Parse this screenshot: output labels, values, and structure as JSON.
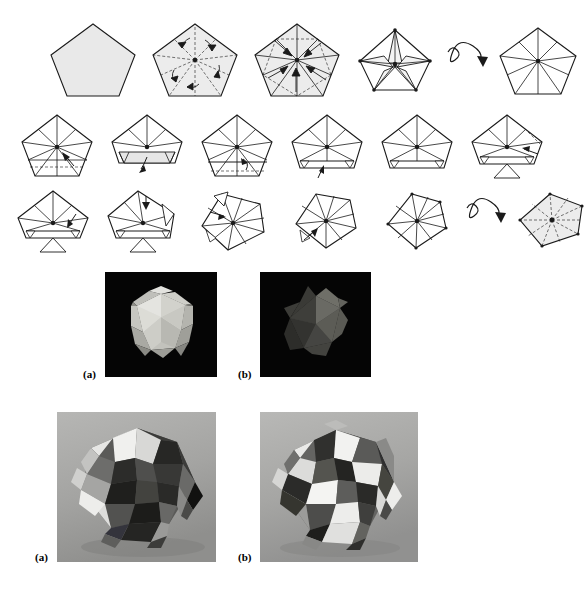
{
  "page": {
    "width": 459,
    "height": 589,
    "background": "#ffffff",
    "ink": "#1a1a1a",
    "fill_light": "#e8e8e8",
    "fill_mid": "#c9c9c9",
    "photo_black": "#050505",
    "photo_gray": "#9a9a9a"
  },
  "figure_diagrams": {
    "name": "pentagon-module-folding-sequence",
    "rows": [
      {
        "row_index": 1,
        "steps": [
          {
            "index": 1,
            "name": "blank-pentagon",
            "kind": "pentagon-plain",
            "shaded": true,
            "arrows": 0,
            "flip": false
          },
          {
            "index": 2,
            "name": "pentagon-crease-pattern",
            "kind": "pentagon-creased-curved-arrows",
            "shaded": true,
            "arrows": 5,
            "flip": false
          },
          {
            "index": 3,
            "name": "pentagon-collapse",
            "kind": "pentagon-collapse-straight-arrows",
            "shaded": true,
            "arrows": 5,
            "flip": false
          },
          {
            "index": 4,
            "name": "star-collapsed",
            "kind": "pentagon-star",
            "shaded": false,
            "arrows": 0,
            "flip": false
          },
          {
            "index": 5,
            "name": "turn-over-symbol",
            "kind": "flip-arrow",
            "shaded": false,
            "arrows": 1,
            "flip": true
          },
          {
            "index": 6,
            "name": "pentagon-ten-sector",
            "kind": "pentagon-radial-10",
            "shaded": false,
            "arrows": 0,
            "flip": false
          }
        ]
      },
      {
        "row_index": 2,
        "steps": [
          {
            "index": 7,
            "name": "fold-lower-edge",
            "kind": "pentagon-radial-fold-hint",
            "shaded": false,
            "arrows": 1,
            "flip": false
          },
          {
            "index": 8,
            "name": "lower-flap-open",
            "kind": "pentagon-flap-pull",
            "shaded": false,
            "arrows": 1,
            "flip": false
          },
          {
            "index": 9,
            "name": "fold-base-band",
            "kind": "pentagon-band-fold",
            "shaded": false,
            "arrows": 1,
            "flip": false
          },
          {
            "index": 10,
            "name": "corner-tabs-formed",
            "kind": "pentagon-corner-tabs",
            "shaded": false,
            "arrows": 1,
            "flip": false
          },
          {
            "index": 11,
            "name": "tabs-set",
            "kind": "pentagon-tabs-set",
            "shaded": false,
            "arrows": 0,
            "flip": false
          },
          {
            "index": 12,
            "name": "repeat-next-side",
            "kind": "pentagon-repeat-side",
            "shaded": false,
            "arrows": 1,
            "flip": false
          }
        ]
      },
      {
        "row_index": 3,
        "steps": [
          {
            "index": 13,
            "name": "third-side-fold",
            "kind": "pentagon-third-side",
            "shaded": false,
            "arrows": 1,
            "flip": false
          },
          {
            "index": 14,
            "name": "fourth-side-fold",
            "kind": "pentagon-fourth-side",
            "shaded": false,
            "arrows": 1,
            "flip": false
          },
          {
            "index": 15,
            "name": "fifth-side-fold",
            "kind": "pentagon-fifth-side",
            "shaded": false,
            "arrows": 1,
            "flip": false
          },
          {
            "index": 16,
            "name": "closing-pinwheel",
            "kind": "pentagon-pinwheel",
            "shaded": false,
            "arrows": 1,
            "flip": false
          },
          {
            "index": 17,
            "name": "finished-unit-front",
            "kind": "pentagon-finished",
            "shaded": false,
            "arrows": 0,
            "flip": false
          },
          {
            "index": 18,
            "name": "turn-over-symbol-2",
            "kind": "flip-arrow",
            "shaded": false,
            "arrows": 1,
            "flip": true
          },
          {
            "index": 19,
            "name": "finished-unit-back",
            "kind": "pentagon-finished-shaded",
            "shaded": true,
            "arrows": 0,
            "flip": false
          }
        ]
      }
    ]
  },
  "photo_figure_top": {
    "name": "single-module-photographs",
    "background": "#050505",
    "items": [
      {
        "label": "(a)",
        "name": "photo-module-front",
        "alt": "photograph of a single folded pentagonal module, front view, pale paper on black background",
        "x": 105,
        "y": 272,
        "w": 112,
        "h": 105,
        "label_x": 83,
        "label_y": 369
      },
      {
        "label": "(b)",
        "name": "photo-module-back",
        "alt": "photograph of a single folded pentagonal module, reverse star view, dark paper on black background",
        "x": 260,
        "y": 272,
        "w": 111,
        "h": 105,
        "label_x": 238,
        "label_y": 369
      }
    ]
  },
  "photo_figure_bottom": {
    "name": "assembled-polyhedra-photographs",
    "background": "#9a9a9a",
    "items": [
      {
        "label": "(a)",
        "name": "photo-assembly-front",
        "alt": "photograph of assembled modular origami polyhedron, dark and light facets, grey studio background",
        "x": 57,
        "y": 412,
        "w": 159,
        "h": 150,
        "label_x": 35,
        "label_y": 552
      },
      {
        "label": "(b)",
        "name": "photo-assembly-back",
        "alt": "photograph of a second assembled modular origami polyhedron with more white facets, grey studio background",
        "x": 260,
        "y": 412,
        "w": 158,
        "h": 150,
        "label_x": 238,
        "label_y": 552
      }
    ]
  }
}
